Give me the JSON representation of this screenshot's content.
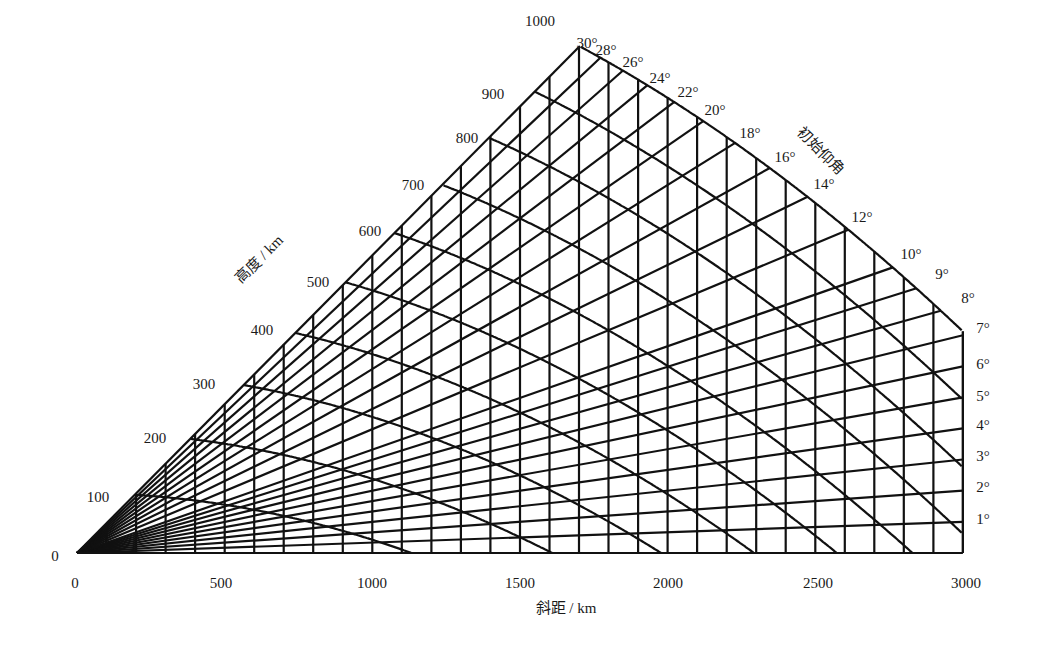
{
  "diagram": {
    "title": "",
    "x_axis": {
      "title": "斜距 / km",
      "title_pos": [
        566,
        606
      ],
      "ticks": [
        {
          "label": "0",
          "value": 0,
          "pos": [
            75,
            583
          ]
        },
        {
          "label": "500",
          "value": 500,
          "pos": [
            221,
            583
          ]
        },
        {
          "label": "1000",
          "value": 1000,
          "pos": [
            372,
            583
          ]
        },
        {
          "label": "1500",
          "value": 1500,
          "pos": [
            520,
            583
          ]
        },
        {
          "label": "2000",
          "value": 2000,
          "pos": [
            668,
            583
          ]
        },
        {
          "label": "2500",
          "value": 2500,
          "pos": [
            818,
            583
          ]
        },
        {
          "label": "3000",
          "value": 3000,
          "pos": [
            966,
            583
          ]
        }
      ]
    },
    "altitude_axis": {
      "title": "高度 / km",
      "title_pos": [
        258,
        258
      ],
      "ticks": [
        {
          "label": "0",
          "value": 0,
          "pos": [
            55,
            556
          ]
        },
        {
          "label": "100",
          "value": 100,
          "pos": [
            98,
            497
          ]
        },
        {
          "label": "200",
          "value": 200,
          "pos": [
            155,
            438
          ]
        },
        {
          "label": "300",
          "value": 300,
          "pos": [
            204,
            384
          ]
        },
        {
          "label": "400",
          "value": 400,
          "pos": [
            262,
            330
          ]
        },
        {
          "label": "500",
          "value": 500,
          "pos": [
            318,
            282
          ]
        },
        {
          "label": "600",
          "value": 600,
          "pos": [
            370,
            231
          ]
        },
        {
          "label": "700",
          "value": 700,
          "pos": [
            413,
            185
          ]
        },
        {
          "label": "800",
          "value": 800,
          "pos": [
            467,
            138
          ]
        },
        {
          "label": "900",
          "value": 900,
          "pos": [
            493,
            94
          ]
        },
        {
          "label": "1000",
          "value": 1000,
          "pos": [
            540,
            21
          ]
        }
      ]
    },
    "elevation_axis": {
      "title": "初始仰角",
      "title_pos": [
        822,
        150
      ],
      "ticks": [
        {
          "label": "30°",
          "value": 30,
          "pos": [
            587,
            43
          ]
        },
        {
          "label": "28°",
          "value": 28,
          "pos": [
            606,
            50
          ]
        },
        {
          "label": "26°",
          "value": 26,
          "pos": [
            633,
            62
          ]
        },
        {
          "label": "24°",
          "value": 24,
          "pos": [
            660,
            78
          ]
        },
        {
          "label": "22°",
          "value": 22,
          "pos": [
            688,
            92
          ]
        },
        {
          "label": "20°",
          "value": 20,
          "pos": [
            715,
            110
          ]
        },
        {
          "label": "18°",
          "value": 18,
          "pos": [
            750,
            133
          ]
        },
        {
          "label": "16°",
          "value": 16,
          "pos": [
            785,
            157
          ]
        },
        {
          "label": "14°",
          "value": 14,
          "pos": [
            824,
            184
          ]
        },
        {
          "label": "12°",
          "value": 12,
          "pos": [
            862,
            217
          ]
        },
        {
          "label": "10°",
          "value": 10,
          "pos": [
            911,
            254
          ]
        },
        {
          "label": "9°",
          "value": 9,
          "pos": [
            942,
            274
          ]
        },
        {
          "label": "8°",
          "value": 8,
          "pos": [
            968,
            298
          ]
        },
        {
          "label": "7°",
          "value": 7,
          "pos": [
            983,
            328
          ]
        },
        {
          "label": "6°",
          "value": 6,
          "pos": [
            983,
            364
          ]
        },
        {
          "label": "5°",
          "value": 5,
          "pos": [
            983,
            396
          ]
        },
        {
          "label": "4°",
          "value": 4,
          "pos": [
            983,
            425
          ]
        },
        {
          "label": "3°",
          "value": 3,
          "pos": [
            983,
            456
          ]
        },
        {
          "label": "2°",
          "value": 2,
          "pos": [
            983,
            487
          ]
        },
        {
          "label": "1°",
          "value": 1,
          "pos": [
            983,
            519
          ]
        }
      ]
    },
    "geometry": {
      "origin_px": [
        77,
        553
      ],
      "px_per_km": 0.2953,
      "vertical_gain": 2.016,
      "earth_radius_km": 6371,
      "max_range_km": 3000,
      "range_step_km": 100,
      "max_altitude_km": 1000,
      "altitude_step_km": 100,
      "max_elevation_deg": 30,
      "elevation_rays_deg": [
        1,
        2,
        3,
        4,
        5,
        6,
        7,
        8,
        9,
        10,
        12,
        14,
        16,
        18,
        20,
        22,
        24,
        26,
        28,
        30
      ],
      "line_color": "#111111",
      "line_width": 2.2
    }
  }
}
